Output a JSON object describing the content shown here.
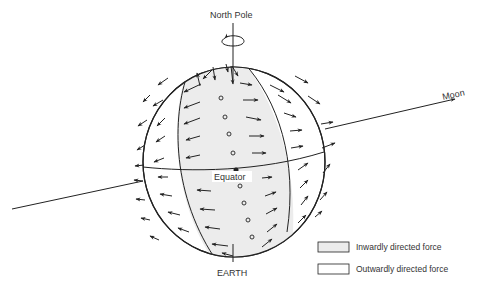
{
  "diagram": {
    "labels": {
      "north_pole": "North Pole",
      "moon": "Moon",
      "equator": "Equator",
      "earth": "EARTH"
    },
    "legend": [
      {
        "label": "Inwardly directed force",
        "fill": "#ececec"
      },
      {
        "label": "Outwardly directed force",
        "fill": "#ffffff"
      }
    ],
    "colors": {
      "ink": "#222222",
      "shaded_band": "#ececec",
      "background": "#ffffff"
    }
  }
}
